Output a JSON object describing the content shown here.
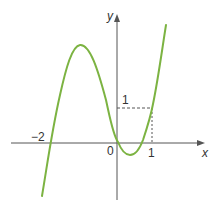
{
  "figure": {
    "type": "function-graph",
    "axes": {
      "x_label": "x",
      "y_label": "y",
      "origin_label": "0"
    },
    "ticks": {
      "x_neg2": "−2",
      "x_1": "1",
      "y_1": "1"
    },
    "curve": {
      "description": "cubic curve with roots at x=-2, x=0 and between 0 and 1, passing through (1,1)",
      "color": "#7cb342",
      "roots": [
        -2,
        0,
        0.67
      ],
      "points_of_interest": [
        {
          "label": "local maximum",
          "x": -1.1,
          "y": 2.8
        },
        {
          "label": "local minimum",
          "x": 0.35,
          "y": -0.35
        },
        {
          "label": "marked point",
          "x": 1,
          "y": 1
        }
      ]
    },
    "guides": {
      "dashed_color": "#555555",
      "horizontal": "y = 1 from x=0 to x=1",
      "vertical": "x = 1 from y=0 to y=1"
    },
    "colors": {
      "axis": "#555555",
      "curve": "#7cb342",
      "text": "#333333"
    }
  }
}
